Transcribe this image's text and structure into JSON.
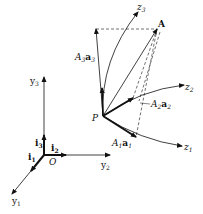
{
  "diagram": {
    "type": "vector-coordinate-diagram",
    "fixed_frame": {
      "origin_label": "O",
      "axes": [
        "y1",
        "y2",
        "y3"
      ],
      "unit_vectors": [
        "i1",
        "i2",
        "i3"
      ]
    },
    "curvilinear_frame": {
      "point_label": "P",
      "axes": [
        "z1",
        "z2",
        "z3"
      ],
      "components": [
        "A1a1",
        "A2a2",
        "A3a3"
      ]
    },
    "vector_label": "A"
  },
  "labels": {
    "O": "O",
    "P": "P",
    "A": "A",
    "y1": "y",
    "y1_sub": "1",
    "y2": "y",
    "y2_sub": "2",
    "y3": "y",
    "y3_sub": "3",
    "i1": "i",
    "i1_sub": "1",
    "i2": "i",
    "i2_sub": "2",
    "i3": "i",
    "i3_sub": "3",
    "z1": "z",
    "z1_sub": "1",
    "z2": "z",
    "z2_sub": "2",
    "z3": "z",
    "z3_sub": "3",
    "A1": "A",
    "A1_sub": "1",
    "a1": "a",
    "a1_sub": "1",
    "A2": "A",
    "A2_sub": "2",
    "a2": "a",
    "a2_sub": "2",
    "A3": "A",
    "A3_sub": "3",
    "a3": "a",
    "a3_sub": "3"
  },
  "colors": {
    "ink": "#111111",
    "background": "#ffffff"
  }
}
